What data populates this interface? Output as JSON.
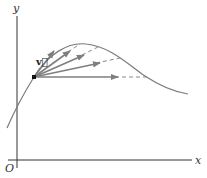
{
  "figure": {
    "axes": {
      "x_label": "x",
      "y_label": "y",
      "origin_label": "O"
    },
    "vector_label": "v⃗",
    "colors": {
      "axis": "#333333",
      "curve": "#7a7a7a",
      "arrow": "#7f7f7f",
      "point": "#111111"
    }
  }
}
